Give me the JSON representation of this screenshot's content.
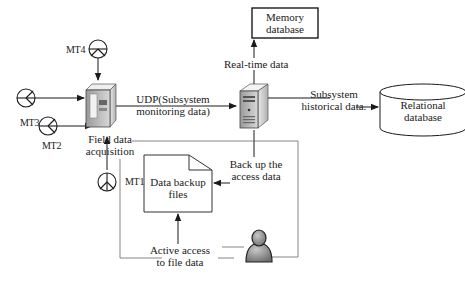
{
  "diagram": {
    "type": "data-flow architecture",
    "nodes": {
      "memory_db": {
        "label_line1": "Memory",
        "label_line2": "database"
      },
      "relational_db": {
        "label_line1": "Relational",
        "label_line2": "database"
      },
      "field_acquisition": {
        "label_line1": "Field data",
        "label_line2": "acquisition"
      },
      "backup_files": {
        "label_line1": "Data backup",
        "label_line2": "files"
      }
    },
    "edges": {
      "udp": {
        "label_line1": "UDP(Subsystem",
        "label_line2": "monitoring data)"
      },
      "realtime": {
        "label": "Real-time data"
      },
      "historical": {
        "label_line1": "Subsystem",
        "label_line2": "historical data."
      },
      "backup": {
        "label_line1": "Back up the",
        "label_line2": "access data"
      },
      "active_access": {
        "label_line1": "Active access",
        "label_line2": "to file data"
      }
    },
    "sensors": [
      {
        "id": "MT4",
        "label": "MT4"
      },
      {
        "id": "MT3",
        "label": "MT3"
      },
      {
        "id": "MT2",
        "label": "MT2"
      },
      {
        "id": "MT1",
        "label": "MT1"
      }
    ],
    "colors": {
      "line": "#1a1a1a",
      "thin_line": "#555555",
      "server_body": "#d9d9d9",
      "user_icon": "#8a8a8a"
    }
  }
}
